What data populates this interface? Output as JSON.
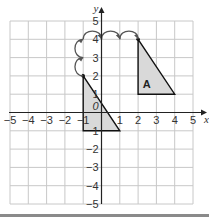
{
  "diagram": {
    "type": "coordinate-grid-translation",
    "axes": {
      "x_label": "x",
      "y_label": "y",
      "x_range": [
        -5,
        5
      ],
      "y_range": [
        -5,
        5
      ],
      "x_ticks": [
        "−5",
        "−4",
        "−3",
        "−2",
        "−1",
        "1",
        "2",
        "3",
        "4",
        "5"
      ],
      "y_ticks_positive": [
        "1",
        "2",
        "3",
        "4",
        "5"
      ],
      "y_ticks_negative": [
        "1",
        "−2",
        "−3",
        "−4",
        "−5"
      ],
      "origin_label": "0"
    },
    "shapes": [
      {
        "name": "original",
        "label": "",
        "vertices": [
          [
            -1,
            2
          ],
          [
            -1,
            -1
          ],
          [
            1,
            -1
          ]
        ],
        "fill": "#d9d9d9",
        "stroke": "#111111"
      },
      {
        "name": "A",
        "label": "A",
        "vertices": [
          [
            2,
            4
          ],
          [
            2,
            1
          ],
          [
            4,
            1
          ]
        ],
        "fill": "#d9d9d9",
        "stroke": "#111111"
      }
    ],
    "translation_arrows": {
      "path": [
        [
          -1,
          2
        ],
        [
          -1,
          3
        ],
        [
          -1,
          4
        ],
        [
          0,
          4
        ],
        [
          1,
          4
        ],
        [
          2,
          4
        ]
      ],
      "description": "2 units up, 3 units right",
      "color": "#555555"
    },
    "colors": {
      "grid": "#c8c8c8",
      "axis": "#222222",
      "shape_fill": "#d9d9d9"
    }
  }
}
